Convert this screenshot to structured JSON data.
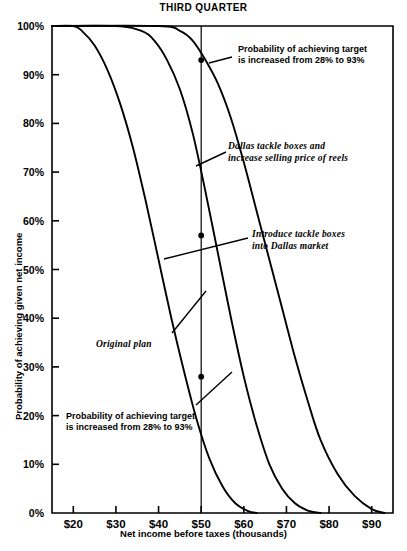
{
  "chart_data": {
    "type": "line",
    "title": "THIRD QUARTER",
    "xlabel": "Net income before taxes (thousands)",
    "ylabel": "Probability of achieving given net income",
    "xlim": [
      15,
      95
    ],
    "ylim": [
      0,
      100
    ],
    "grid": false,
    "legend": "none",
    "xticks": [
      "$20",
      "$30",
      "$40",
      "$50",
      "$60",
      "$70",
      "$80",
      "$90"
    ],
    "xtick_values": [
      20,
      30,
      40,
      50,
      60,
      70,
      80,
      90
    ],
    "yticks": [
      "0%",
      "10%",
      "20%",
      "30%",
      "40%",
      "50%",
      "60%",
      "70%",
      "80%",
      "90%",
      "100%"
    ],
    "ytick_values": [
      0,
      10,
      20,
      30,
      40,
      50,
      60,
      70,
      80,
      90,
      100
    ],
    "reference_line_x": 50,
    "series": [
      {
        "name": "Original plan",
        "x": [
          15,
          20,
          22,
          25,
          28,
          31,
          34,
          37,
          40,
          43,
          46,
          49,
          52,
          55,
          58,
          61,
          63
        ],
        "y": [
          100,
          100,
          99,
          96,
          91,
          84,
          75,
          64,
          52,
          40,
          29,
          19,
          11,
          5.5,
          2,
          0.4,
          0
        ]
      },
      {
        "name": "Introduce tackle boxes into Dallas market",
        "x": [
          15,
          30,
          36,
          39,
          42,
          45,
          48,
          51,
          54,
          57,
          60,
          63,
          66,
          69,
          72,
          75,
          78
        ],
        "y": [
          100,
          100,
          99,
          97,
          93,
          87,
          78,
          66,
          53,
          40,
          28,
          18,
          10,
          5,
          2,
          0.5,
          0
        ]
      },
      {
        "name": "Dallas tackle boxes and increase selling price of reels",
        "x": [
          15,
          40,
          45,
          48,
          51,
          54,
          57,
          60,
          63,
          66,
          69,
          72,
          75,
          78,
          82,
          86,
          90,
          93
        ],
        "y": [
          100,
          100,
          99,
          97,
          93,
          88,
          81,
          72,
          62,
          52,
          42,
          32,
          23,
          15,
          8,
          3.5,
          0.8,
          0
        ]
      }
    ],
    "markers": [
      {
        "name": "target-93",
        "x": 50,
        "y": 93
      },
      {
        "name": "midpoint-57",
        "x": 50,
        "y": 57
      },
      {
        "name": "target-28",
        "x": 50,
        "y": 28
      }
    ],
    "annotations": [
      {
        "id": "ann-upper-probability",
        "style": "upright",
        "lines": [
          "Probability of achieving target",
          "is increased from 28% to 93%"
        ]
      },
      {
        "id": "ann-dallas-reels",
        "style": "italic",
        "lines": [
          "Dallas tackle boxes and",
          "increase selling price of reels"
        ]
      },
      {
        "id": "ann-introduce-dallas",
        "style": "italic",
        "lines": [
          "Introduce tackle boxes",
          "into Dallas market"
        ]
      },
      {
        "id": "ann-original-plan",
        "style": "italic",
        "lines": [
          "Original plan"
        ]
      },
      {
        "id": "ann-lower-probability",
        "style": "upright",
        "lines": [
          "Probability of achieving target",
          "is increased from 28% to 93%"
        ]
      }
    ],
    "colors": {
      "ink": "#000000",
      "background": "#ffffff"
    }
  }
}
